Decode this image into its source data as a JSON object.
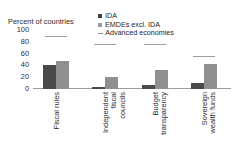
{
  "chart_data": {
    "type": "bar",
    "title": "",
    "ylabel": "Percent of countries",
    "xlabel": "",
    "ylim": [
      0,
      100
    ],
    "yticks": [
      100,
      80,
      60,
      40,
      20,
      0
    ],
    "grid": false,
    "legend_position": "top-right",
    "categories": [
      "Fiscal rules",
      "Independent fiscal councils",
      "Budget transparency",
      "Sovereign wealth funds"
    ],
    "category_lines": [
      [
        "Fiscal rules"
      ],
      [
        "Independent",
        "fiscal",
        "councils"
      ],
      [
        "Budget",
        "transparency"
      ],
      [
        "Sovereign",
        "wealth funds"
      ]
    ],
    "series": [
      {
        "name": "IDA",
        "type": "bar",
        "color": "#4a4a4a",
        "values": [
          41,
          3,
          6,
          11
        ]
      },
      {
        "name": "EMDEs excl. IDA",
        "type": "bar",
        "color": "#8f8f8f",
        "values": [
          48,
          21,
          32,
          42
        ]
      },
      {
        "name": "Advanced economies",
        "type": "marker",
        "color": "#9e9e9e",
        "values": [
          88,
          75,
          75,
          54
        ]
      }
    ]
  },
  "legend": {
    "items": [
      {
        "label": "IDA",
        "marker": "square-dark"
      },
      {
        "label": "EMDEs excl. IDA",
        "marker": "square-light"
      },
      {
        "label": "Advanced economies",
        "marker": "dash-line"
      }
    ]
  },
  "axis": {
    "y_title": "Percent of countries",
    "y_tick_labels": [
      "100",
      "80",
      "60",
      "40",
      "20",
      "0"
    ]
  }
}
